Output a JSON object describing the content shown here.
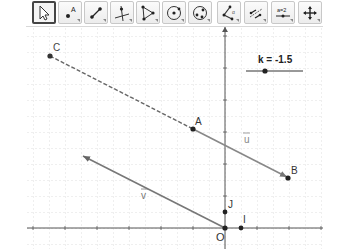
{
  "toolbar": {
    "tools": [
      {
        "name": "move-tool",
        "icon": "cursor-arrow-icon",
        "active": true
      },
      {
        "name": "point-tool",
        "icon": "point-icon"
      },
      {
        "name": "segment-tool",
        "icon": "segment-icon"
      },
      {
        "name": "perpendicular-line-tool",
        "icon": "perpendicular-icon"
      },
      {
        "name": "polygon-tool",
        "icon": "polygon-icon"
      },
      {
        "name": "circle-center-point-tool",
        "icon": "circle-center-icon"
      },
      {
        "name": "circle-three-points-tool",
        "icon": "circle-three-points-icon"
      },
      {
        "name": "angle-tool",
        "icon": "angle-icon"
      },
      {
        "name": "reflect-tool",
        "icon": "reflect-icon"
      },
      {
        "name": "slider-tool",
        "icon": "slider-icon",
        "text": "a=2"
      },
      {
        "name": "move-graphics-view-tool",
        "icon": "move-view-icon"
      }
    ]
  },
  "graphics": {
    "unit_px": 16,
    "origin_px": [
      225,
      201
    ],
    "points": [
      {
        "label": "C",
        "x": -11,
        "y": 9.5
      },
      {
        "label": "A",
        "x": -2,
        "y": 5
      },
      {
        "label": "B",
        "x": 4,
        "y": 2
      },
      {
        "label": "O",
        "x": 0,
        "y": 0
      },
      {
        "label": "I",
        "x": 1,
        "y": 0
      },
      {
        "label": "J",
        "x": 0,
        "y": 1
      }
    ],
    "vectors": [
      {
        "label": "u",
        "from": "A",
        "to": "B"
      },
      {
        "label": "v",
        "from": "O",
        "to": [
          -9,
          4.5
        ]
      }
    ],
    "dashed_segment": {
      "from": "C",
      "to": "A"
    },
    "slider": {
      "label": "k = -1.5",
      "name": "k",
      "value": -1.5
    }
  }
}
